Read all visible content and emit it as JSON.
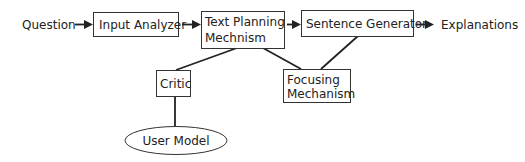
{
  "diagram": {
    "type": "flow-architecture",
    "colors": {
      "stroke": "#333333",
      "text": "#222222",
      "background": "#ffffff"
    },
    "input_label": "Question",
    "output_label": "Explanations",
    "nodes": {
      "input_analyzer": {
        "label": "Input Analyzer",
        "shape": "rect"
      },
      "text_planning": {
        "line1": "Text Planning",
        "line2": "Mechnism",
        "shape": "rect"
      },
      "sentence_generator": {
        "label": "Sentence Generator",
        "shape": "rect"
      },
      "critic": {
        "label": "Critic",
        "shape": "rect"
      },
      "focusing": {
        "line1": "Focusing",
        "line2": "Mechanism",
        "shape": "rect"
      },
      "user_model": {
        "label": "User Model",
        "shape": "ellipse"
      }
    },
    "edges": [
      {
        "from": "Question",
        "to": "Input Analyzer",
        "type": "arrow"
      },
      {
        "from": "Input Analyzer",
        "to": "Text Planning Mechnism",
        "type": "arrow"
      },
      {
        "from": "Text Planning Mechnism",
        "to": "Sentence Generator",
        "type": "arrow"
      },
      {
        "from": "Sentence Generator",
        "to": "Explanations",
        "type": "arrow"
      },
      {
        "from": "Text Planning Mechnism",
        "to": "Critic",
        "type": "line"
      },
      {
        "from": "Text Planning Mechnism",
        "to": "Focusing Mechanism",
        "type": "line"
      },
      {
        "from": "Sentence Generator",
        "to": "Focusing Mechanism",
        "type": "line"
      },
      {
        "from": "Critic",
        "to": "User Model",
        "type": "line"
      }
    ]
  }
}
